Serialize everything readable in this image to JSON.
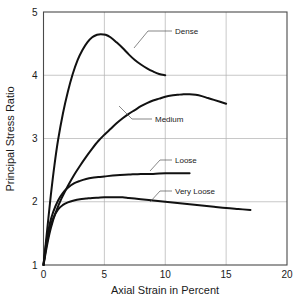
{
  "chart_data": {
    "type": "line",
    "title": "",
    "xlabel": "Axial Strain in Percent",
    "ylabel": "Principal Stress Ratio",
    "xlim": [
      0,
      20
    ],
    "ylim": [
      1,
      5
    ],
    "xticks": [
      "0",
      "5",
      "10",
      "15",
      "20"
    ],
    "yticks": [
      "1",
      "2",
      "3",
      "4",
      "5"
    ],
    "xtick_values": [
      0,
      5,
      10,
      15,
      20
    ],
    "ytick_values": [
      1,
      2,
      3,
      4,
      5
    ],
    "grid": true,
    "legend_position": "inline-annotations",
    "series": [
      {
        "name": "Dense",
        "label": "Dense",
        "color": "#111111",
        "points": [
          [
            0.0,
            1.0
          ],
          [
            0.3,
            1.55
          ],
          [
            0.6,
            2.1
          ],
          [
            0.9,
            2.58
          ],
          [
            1.2,
            2.98
          ],
          [
            1.6,
            3.4
          ],
          [
            2.0,
            3.74
          ],
          [
            2.4,
            4.02
          ],
          [
            2.8,
            4.24
          ],
          [
            3.2,
            4.4
          ],
          [
            3.6,
            4.52
          ],
          [
            4.0,
            4.6
          ],
          [
            4.4,
            4.64
          ],
          [
            4.7,
            4.65
          ],
          [
            5.1,
            4.64
          ],
          [
            5.5,
            4.6
          ],
          [
            6.0,
            4.52
          ],
          [
            6.5,
            4.43
          ],
          [
            7.0,
            4.33
          ],
          [
            7.5,
            4.24
          ],
          [
            8.0,
            4.17
          ],
          [
            8.5,
            4.11
          ],
          [
            9.0,
            4.06
          ],
          [
            9.5,
            4.02
          ],
          [
            10.0,
            4.0
          ]
        ]
      },
      {
        "name": "Medium",
        "label": "Medium",
        "color": "#111111",
        "points": [
          [
            0.0,
            1.0
          ],
          [
            0.3,
            1.32
          ],
          [
            0.6,
            1.58
          ],
          [
            1.0,
            1.83
          ],
          [
            1.5,
            2.06
          ],
          [
            2.0,
            2.25
          ],
          [
            2.5,
            2.42
          ],
          [
            3.0,
            2.57
          ],
          [
            3.5,
            2.71
          ],
          [
            4.0,
            2.84
          ],
          [
            4.5,
            2.96
          ],
          [
            5.0,
            3.06
          ],
          [
            5.5,
            3.15
          ],
          [
            6.0,
            3.24
          ],
          [
            6.5,
            3.32
          ],
          [
            7.0,
            3.39
          ],
          [
            7.5,
            3.45
          ],
          [
            8.0,
            3.51
          ],
          [
            8.5,
            3.56
          ],
          [
            9.0,
            3.6
          ],
          [
            9.5,
            3.63
          ],
          [
            10.0,
            3.66
          ],
          [
            10.5,
            3.68
          ],
          [
            11.0,
            3.69
          ],
          [
            11.5,
            3.7
          ],
          [
            12.0,
            3.7
          ],
          [
            12.5,
            3.69
          ],
          [
            13.0,
            3.67
          ],
          [
            13.5,
            3.64
          ],
          [
            14.0,
            3.61
          ],
          [
            14.5,
            3.58
          ],
          [
            15.0,
            3.55
          ]
        ]
      },
      {
        "name": "Loose",
        "label": "Loose",
        "color": "#111111",
        "points": [
          [
            0.0,
            1.0
          ],
          [
            0.25,
            1.38
          ],
          [
            0.5,
            1.64
          ],
          [
            0.8,
            1.84
          ],
          [
            1.2,
            2.02
          ],
          [
            1.6,
            2.14
          ],
          [
            2.0,
            2.22
          ],
          [
            2.5,
            2.29
          ],
          [
            3.0,
            2.33
          ],
          [
            3.5,
            2.36
          ],
          [
            4.0,
            2.38
          ],
          [
            4.5,
            2.39
          ],
          [
            5.0,
            2.4
          ],
          [
            6.0,
            2.42
          ],
          [
            7.0,
            2.43
          ],
          [
            8.0,
            2.44
          ],
          [
            9.0,
            2.44
          ],
          [
            10.0,
            2.45
          ],
          [
            11.0,
            2.45
          ],
          [
            12.0,
            2.45
          ]
        ]
      },
      {
        "name": "Very Loose",
        "label": "Very Loose",
        "color": "#111111",
        "points": [
          [
            0.0,
            1.0
          ],
          [
            0.25,
            1.32
          ],
          [
            0.5,
            1.55
          ],
          [
            0.8,
            1.74
          ],
          [
            1.2,
            1.88
          ],
          [
            1.6,
            1.95
          ],
          [
            2.0,
            1.99
          ],
          [
            2.5,
            2.02
          ],
          [
            3.0,
            2.04
          ],
          [
            3.5,
            2.05
          ],
          [
            4.0,
            2.06
          ],
          [
            4.5,
            2.065
          ],
          [
            5.0,
            2.07
          ],
          [
            5.5,
            2.07
          ],
          [
            6.0,
            2.07
          ],
          [
            6.5,
            2.07
          ],
          [
            7.0,
            2.06
          ],
          [
            7.5,
            2.05
          ],
          [
            8.0,
            2.04
          ],
          [
            9.0,
            2.02
          ],
          [
            10.0,
            2.0
          ],
          [
            11.0,
            1.98
          ],
          [
            12.0,
            1.96
          ],
          [
            13.0,
            1.94
          ],
          [
            14.0,
            1.92
          ],
          [
            15.0,
            1.9
          ],
          [
            16.0,
            1.885
          ],
          [
            17.0,
            1.87
          ]
        ]
      }
    ],
    "annotations": [
      {
        "text": "Dense",
        "label_x": 175,
        "label_y": 34,
        "leader": "M 172,31 L 148,31 L 134,48"
      },
      {
        "text": "Medium",
        "label_x": 155,
        "label_y": 122,
        "leader": "M 152,119 L 132,119 L 119,106"
      },
      {
        "text": "Loose",
        "label_x": 175,
        "label_y": 163,
        "leader": "M 172,160 L 160,160 L 150,171"
      },
      {
        "text": "Very Loose",
        "label_x": 175,
        "label_y": 194,
        "leader": "M 172,191 L 160,191 L 150,202"
      }
    ]
  }
}
